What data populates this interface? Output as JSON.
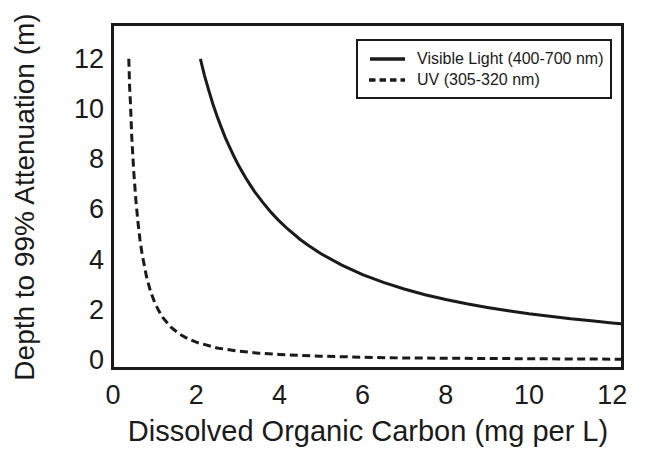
{
  "figure": {
    "background": "#ffffff",
    "ink_color": "#1a1a1a"
  },
  "chart_data": {
    "type": "line",
    "title": "",
    "xlabel": "Dissolved Organic Carbon (mg per L)",
    "ylabel": "Depth to 99% Attenuation (m)",
    "x_ticks": [
      0,
      2,
      4,
      6,
      8,
      10,
      12
    ],
    "y_ticks": [
      0,
      2,
      4,
      6,
      8,
      10,
      12
    ],
    "xlim": [
      0,
      12.26
    ],
    "ylim": [
      -0.36,
      13.35
    ],
    "grid": false,
    "legend": {
      "position": "top-right",
      "boxed": true
    },
    "series": [
      {
        "id": "visible-light",
        "name": "Visible Light (400-700 nm)",
        "line_style": "solid",
        "color": "#1a1a1a",
        "points": [
          [
            2.1,
            12.0
          ],
          [
            2.2,
            11.33
          ],
          [
            2.3,
            10.75
          ],
          [
            2.4,
            10.21
          ],
          [
            2.5,
            9.72
          ],
          [
            2.6,
            9.28
          ],
          [
            2.7,
            8.86
          ],
          [
            2.8,
            8.49
          ],
          [
            2.9,
            8.14
          ],
          [
            3.0,
            7.81
          ],
          [
            3.1,
            7.51
          ],
          [
            3.2,
            7.23
          ],
          [
            3.3,
            6.97
          ],
          [
            3.4,
            6.72
          ],
          [
            3.6,
            6.28
          ],
          [
            3.8,
            5.88
          ],
          [
            4.0,
            5.53
          ],
          [
            4.2,
            5.22
          ],
          [
            4.5,
            4.8
          ],
          [
            4.7,
            4.56
          ],
          [
            5.0,
            4.23
          ],
          [
            5.5,
            3.78
          ],
          [
            6.0,
            3.4
          ],
          [
            6.5,
            3.09
          ],
          [
            7.0,
            2.83
          ],
          [
            7.5,
            2.6
          ],
          [
            8.0,
            2.41
          ],
          [
            8.5,
            2.24
          ],
          [
            9.0,
            2.09
          ],
          [
            9.5,
            1.96
          ],
          [
            10.0,
            1.84
          ],
          [
            10.5,
            1.74
          ],
          [
            11.0,
            1.64
          ],
          [
            11.5,
            1.56
          ],
          [
            12.0,
            1.48
          ],
          [
            12.26,
            1.44
          ]
        ]
      },
      {
        "id": "uv",
        "name": "UV (305-320 nm)",
        "line_style": "dashed",
        "color": "#1a1a1a",
        "points": [
          [
            0.38,
            12.0
          ],
          [
            0.4,
            10.9
          ],
          [
            0.42,
            10.2
          ],
          [
            0.45,
            8.94
          ],
          [
            0.5,
            7.47
          ],
          [
            0.55,
            6.36
          ],
          [
            0.6,
            5.48
          ],
          [
            0.65,
            4.78
          ],
          [
            0.7,
            4.22
          ],
          [
            0.8,
            3.36
          ],
          [
            0.9,
            2.75
          ],
          [
            1.0,
            2.3
          ],
          [
            1.1,
            1.96
          ],
          [
            1.2,
            1.69
          ],
          [
            1.4,
            1.3
          ],
          [
            1.6,
            1.03
          ],
          [
            1.8,
            0.85
          ],
          [
            2.0,
            0.71
          ],
          [
            2.5,
            0.48
          ],
          [
            3.0,
            0.36
          ],
          [
            3.5,
            0.27
          ],
          [
            4.0,
            0.22
          ],
          [
            5.0,
            0.15
          ],
          [
            6.0,
            0.11
          ],
          [
            7.0,
            0.08
          ],
          [
            8.0,
            0.07
          ],
          [
            9.0,
            0.06
          ],
          [
            10.0,
            0.05
          ],
          [
            11.0,
            0.04
          ],
          [
            12.26,
            0.03
          ]
        ]
      }
    ]
  }
}
